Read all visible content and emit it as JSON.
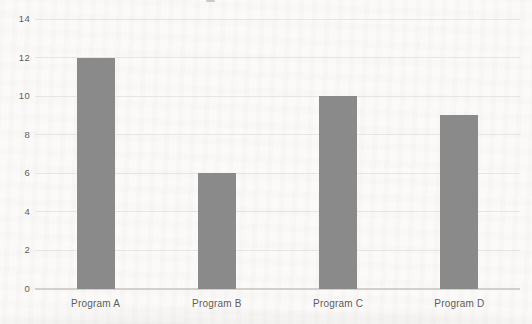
{
  "chart_data": {
    "type": "bar",
    "title": "",
    "categories": [
      "Program A",
      "Program B",
      "Program C",
      "Program D"
    ],
    "values": [
      12,
      6,
      10,
      9
    ],
    "xlabel": "",
    "ylabel": "",
    "ylim": [
      0,
      14
    ],
    "yticks": [
      0,
      2,
      4,
      6,
      8,
      10,
      12,
      14
    ],
    "grid": "horizontal",
    "legend_position": "none",
    "bar_color": "#8a8a8a",
    "gridline_color": "#e7e5e2",
    "axis_line_color": "#d2d0cc",
    "text_color": "#5d5c5a",
    "background_color": "#fbfaf9"
  }
}
